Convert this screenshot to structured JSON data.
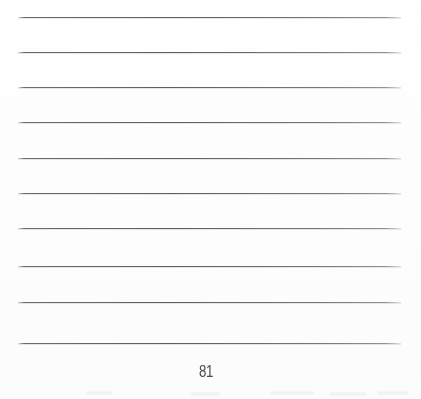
{
  "document": {
    "type": "scanned-lined-page",
    "page_number": "81",
    "background_color": "#fefefe",
    "rule_color": "#5a5a5e",
    "page_width": 421,
    "page_height": 399,
    "rule_count": 10,
    "rule_left": 18,
    "rule_right": 401,
    "rule_spacing": 35,
    "content_text": ""
  },
  "rules": [
    {
      "label": "ruled-line-1",
      "y": 17
    },
    {
      "label": "ruled-line-2",
      "y": 52
    },
    {
      "label": "ruled-line-3",
      "y": 87
    },
    {
      "label": "ruled-line-4",
      "y": 122
    },
    {
      "label": "ruled-line-5",
      "y": 158
    },
    {
      "label": "ruled-line-6",
      "y": 193
    },
    {
      "label": "ruled-line-7",
      "y": 228
    },
    {
      "label": "ruled-line-8",
      "y": 266
    },
    {
      "label": "ruled-line-9",
      "y": 302
    },
    {
      "label": "ruled-line-10",
      "y": 343
    }
  ],
  "footer": {
    "page_number": "81",
    "center_x": 206,
    "y": 363
  },
  "artifacts": [
    {
      "label": "bleed-1",
      "x": 86,
      "y": 392,
      "width": 26
    },
    {
      "label": "bleed-2",
      "x": 190,
      "y": 393,
      "width": 30
    },
    {
      "label": "bleed-3",
      "x": 270,
      "y": 392,
      "width": 44
    },
    {
      "label": "bleed-4",
      "x": 330,
      "y": 393,
      "width": 36
    },
    {
      "label": "bleed-5",
      "x": 378,
      "y": 392,
      "width": 30
    }
  ]
}
